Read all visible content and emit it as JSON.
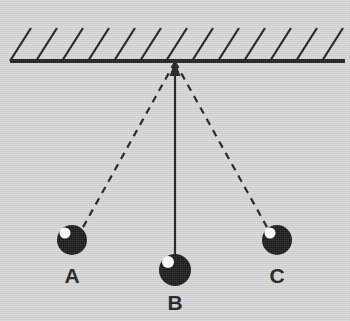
{
  "figure": {
    "background_color": "#d5d5d5",
    "ink_color": "#111111",
    "highlight_color": "#ffffff",
    "width": 350,
    "height": 321
  },
  "ceiling": {
    "name": "support-ceiling",
    "line_y": 61,
    "x_start": 10,
    "x_end": 345,
    "thickness": 4,
    "hatch_count": 13,
    "hatch_spacing": 26,
    "hatch_rise": 33,
    "hatch_run": 21
  },
  "pivot": {
    "name": "pivot-point",
    "x": 175,
    "y": 62,
    "arrow": "up-arrow"
  },
  "bobs": [
    {
      "id": "A",
      "label": "A",
      "name": "pendulum-bob-a",
      "cx": 72,
      "cy": 240,
      "r": 15,
      "highlight_cx": 65,
      "highlight_cy": 233,
      "highlight_r": 5.5,
      "label_x": 72,
      "label_y": 283,
      "string_style": "dashed"
    },
    {
      "id": "B",
      "label": "B",
      "name": "pendulum-bob-b",
      "cx": 175,
      "cy": 270,
      "r": 16,
      "highlight_cx": 168,
      "highlight_cy": 262,
      "highlight_r": 6,
      "label_x": 175,
      "label_y": 310,
      "string_style": "solid"
    },
    {
      "id": "C",
      "label": "C",
      "name": "pendulum-bob-c",
      "cx": 277,
      "cy": 240,
      "r": 15,
      "highlight_cx": 270,
      "highlight_cy": 233,
      "highlight_r": 5.5,
      "label_x": 277,
      "label_y": 283,
      "string_style": "dashed"
    }
  ],
  "strings": {
    "dash_pattern": "7 6",
    "stroke_width_dashed": 2.2,
    "stroke_width_solid": 2.2
  }
}
